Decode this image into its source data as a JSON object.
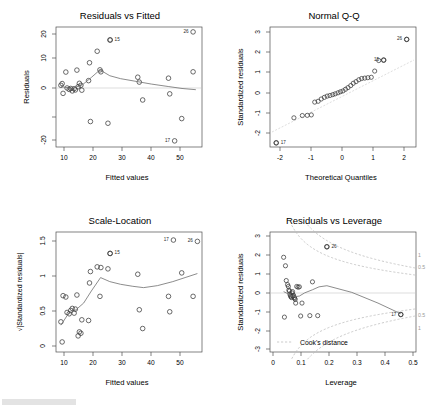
{
  "figure": {
    "kind": "regression-diagnostic-plots",
    "layout": "2x2",
    "background": "#ffffff",
    "point_color": "#3a3a3a",
    "smoother_color": "#6e6e6e",
    "reference_color": "#cfcfcf",
    "cooks_contour_color": "#b9b9b9"
  },
  "chart_data": [
    {
      "type": "scatter",
      "panel": "top-left",
      "title": "Residuals vs Fitted",
      "xlabel": "Fitted values",
      "ylabel": "Residuals",
      "xlim": [
        7.0,
        54.5
      ],
      "ylim": [
        -25.5,
        23.5
      ],
      "xticks": [
        10,
        20,
        30,
        40,
        50
      ],
      "yticks": [
        -20,
        0,
        10,
        20
      ],
      "grid": false,
      "reference_line": {
        "type": "horizontal",
        "y": 0
      },
      "x": [
        8.6,
        9.0,
        9.3,
        10.2,
        10.6,
        11.3,
        11.8,
        12.3,
        12.9,
        13.3,
        13.8,
        14.2,
        14.6,
        15.1,
        15.4,
        17.6,
        17.9,
        18.2,
        20.4,
        21.3,
        21.6,
        23.9,
        24.6,
        33.6,
        34.1,
        35.2,
        43.6,
        44.0,
        47.9,
        51.6
      ],
      "y": [
        -0.3,
        0.4,
        -3.6,
        5.1,
        -1.4,
        -2.0,
        -1.6,
        -2.6,
        -1.7,
        -2.2,
        5.9,
        -0.9,
        0.5,
        -0.3,
        -2.3,
        1.6,
        8.9,
        -15.1,
        13.6,
        6.0,
        5.2,
        -15.8,
        18.2,
        3.0,
        1.0,
        -6.3,
        2.6,
        -3.8,
        -13.9,
        5.2
      ],
      "smoother": {
        "type": "lowess",
        "x": [
          8.6,
          12.0,
          15.5,
          18.5,
          21.3,
          24.5,
          28.0,
          33.5,
          38.0,
          43.5,
          48.0,
          52.5
        ],
        "y": [
          -0.8,
          -1.6,
          -0.2,
          2.9,
          6.0,
          3.6,
          2.4,
          1.2,
          0.2,
          -0.8,
          -1.6,
          -2.1
        ]
      },
      "labeled_points": [
        {
          "label": "15",
          "x": 24.6,
          "y": 18.2
        },
        {
          "label": "26",
          "x": 51.6,
          "y": 21.5
        },
        {
          "label": "17",
          "x": 45.6,
          "y": -23.0
        }
      ]
    },
    {
      "type": "scatter",
      "panel": "top-right",
      "title": "Normal Q-Q",
      "xlabel": "Theoretical Quantiles",
      "ylabel": "Standardized residuals",
      "xlim": [
        -2.35,
        2.35
      ],
      "ylim": [
        -2.75,
        3.05
      ],
      "xticks": [
        -2,
        -1,
        0,
        1,
        2
      ],
      "yticks": [
        -2,
        -1,
        0,
        1,
        2,
        3
      ],
      "grid": false,
      "reference_line": {
        "type": "qq-line",
        "dashed": true
      },
      "x": [
        -2.15,
        -1.58,
        -1.31,
        -1.15,
        -1.02,
        -0.91,
        -0.8,
        -0.7,
        -0.6,
        -0.51,
        -0.42,
        -0.33,
        -0.25,
        -0.16,
        -0.08,
        0.0,
        0.08,
        0.16,
        0.25,
        0.33,
        0.42,
        0.51,
        0.6,
        0.7,
        0.8,
        0.91,
        1.02,
        1.15,
        1.31,
        2.05
      ],
      "y": [
        -2.55,
        -1.34,
        -1.23,
        -1.22,
        -1.2,
        -0.58,
        -0.54,
        -0.43,
        -0.35,
        -0.29,
        -0.26,
        -0.22,
        -0.18,
        -0.13,
        -0.08,
        -0.04,
        0.04,
        0.12,
        0.22,
        0.33,
        0.41,
        0.5,
        0.56,
        0.58,
        0.6,
        0.62,
        0.92,
        1.43,
        1.45,
        2.45
      ],
      "labeled_points": [
        {
          "label": "17",
          "x": -2.15,
          "y": -2.55
        },
        {
          "label": "15",
          "x": 1.31,
          "y": 1.45
        },
        {
          "label": "26",
          "x": 2.05,
          "y": 2.45
        }
      ]
    },
    {
      "type": "scatter",
      "panel": "bottom-left",
      "title": "Scale-Location",
      "xlabel": "Fitted values",
      "ylabel": "√|Standardized residuals|",
      "xlim": [
        7.0,
        54.5
      ],
      "ylim": [
        -0.07,
        1.72
      ],
      "xticks": [
        10,
        20,
        30,
        40,
        50
      ],
      "yticks": [
        0.0,
        0.5,
        1.0,
        1.5
      ],
      "grid": false,
      "x": [
        8.6,
        9.0,
        9.3,
        10.2,
        10.6,
        11.3,
        11.8,
        12.3,
        12.9,
        13.3,
        13.8,
        14.2,
        14.6,
        15.1,
        15.4,
        17.6,
        17.9,
        18.2,
        20.4,
        21.3,
        21.6,
        23.9,
        24.6,
        33.6,
        34.1,
        35.2,
        43.6,
        44.0,
        47.9,
        51.6
      ],
      "y": [
        0.38,
        0.08,
        0.77,
        0.75,
        0.52,
        0.5,
        0.55,
        0.58,
        0.51,
        0.57,
        0.78,
        0.17,
        0.23,
        0.21,
        0.41,
        0.4,
        0.96,
        1.13,
        1.2,
        0.76,
        1.19,
        1.17,
        1.4,
        1.09,
        0.56,
        0.28,
        0.76,
        0.53,
        1.11,
        0.76
      ],
      "smoother": {
        "type": "lowess",
        "x": [
          8.6,
          11.0,
          13.5,
          16.0,
          18.5,
          21.5,
          24.5,
          28.0,
          32.0,
          35.5,
          40.0,
          45.0,
          49.0,
          53.0
        ],
        "y": [
          0.33,
          0.5,
          0.56,
          0.66,
          0.84,
          1.04,
          0.98,
          0.94,
          0.91,
          0.89,
          0.92,
          0.98,
          1.04,
          1.1
        ]
      },
      "labeled_points": [
        {
          "label": "15",
          "x": 24.6,
          "y": 1.4
        },
        {
          "label": "17",
          "x": 45.2,
          "y": 1.6
        },
        {
          "label": "26",
          "x": 53.0,
          "y": 1.58
        }
      ]
    },
    {
      "type": "scatter",
      "panel": "bottom-right",
      "title": "Residuals vs Leverage",
      "xlabel": "Leverage",
      "ylabel": "Standardized residuals",
      "xlim": [
        -0.012,
        0.545
      ],
      "ylim": [
        -3.25,
        3.25
      ],
      "xticks": [
        0.0,
        0.1,
        0.2,
        0.3,
        0.4,
        0.5
      ],
      "yticks": [
        -3,
        -2,
        -1,
        0,
        1,
        2,
        3
      ],
      "grid": false,
      "reference_line": {
        "type": "horizontal",
        "y": 0
      },
      "x": [
        0.04,
        0.043,
        0.047,
        0.05,
        0.055,
        0.058,
        0.06,
        0.062,
        0.064,
        0.066,
        0.068,
        0.07,
        0.072,
        0.074,
        0.076,
        0.078,
        0.08,
        0.082,
        0.084,
        0.086,
        0.09,
        0.095,
        0.1,
        0.105,
        0.11,
        0.14,
        0.15,
        0.17,
        0.205,
        0.487
      ],
      "y": [
        1.88,
        -1.36,
        1.42,
        0.62,
        0.4,
        0.3,
        0.1,
        0.05,
        -0.12,
        -0.2,
        -0.26,
        -0.3,
        -0.05,
        0.02,
        -0.22,
        -0.18,
        -0.3,
        -0.34,
        -0.4,
        -0.6,
        0.3,
        0.26,
        0.28,
        -1.3,
        -0.6,
        -1.28,
        0.55,
        -1.28,
        2.45,
        -1.22
      ],
      "smoother": {
        "type": "lowess",
        "x": [
          0.04,
          0.06,
          0.08,
          0.1,
          0.12,
          0.15,
          0.175,
          0.205,
          0.3,
          0.4,
          0.487
        ],
        "y": [
          0.02,
          -0.12,
          -0.26,
          -0.22,
          -0.05,
          0.12,
          0.28,
          0.34,
          -0.02,
          -0.6,
          -1.18
        ]
      },
      "labeled_points": [
        {
          "label": "26",
          "x": 0.205,
          "y": 2.45
        },
        {
          "label": "17",
          "x": 0.487,
          "y": -1.22
        }
      ],
      "cooks_distance": {
        "legend": "Cook's distance",
        "contour_levels": [
          1,
          0.5
        ],
        "right_labels_upper": [
          "1",
          "0.5"
        ],
        "right_labels_lower": [
          "0.5",
          "1"
        ]
      }
    }
  ]
}
